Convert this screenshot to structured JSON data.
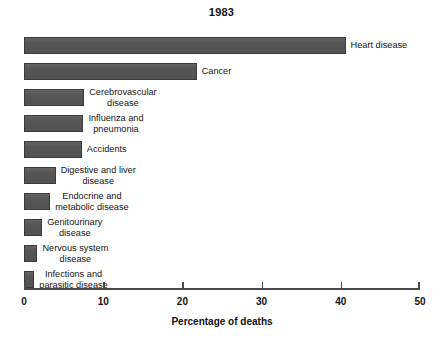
{
  "chart_data": {
    "type": "bar",
    "orientation": "horizontal",
    "title": "1983",
    "xlabel": "Percentage of deaths",
    "ylabel": "",
    "xlim": [
      0,
      50
    ],
    "xticks": [
      0,
      10,
      20,
      30,
      40,
      50
    ],
    "xtick_labels": [
      "0",
      "10",
      "20",
      "30",
      "40",
      "50"
    ],
    "grid": false,
    "legend": null,
    "bar_color": "#575757",
    "bar_edge_color": "#3a3a3a",
    "categories": [
      "Heart disease",
      "Cancer",
      "Cerebrovascular disease",
      "Influenza and pneumonia",
      "Accidents",
      "Digestive and liver disease",
      "Endocrine and metabolic disease",
      "Genitourinary disease",
      "Nervous system disease",
      "Infections and parasitic disease"
    ],
    "values": [
      40.6,
      21.8,
      7.6,
      7.5,
      7.3,
      4.0,
      3.3,
      2.3,
      1.7,
      1.3
    ],
    "bars": [
      {
        "label_lines": [
          "Heart disease"
        ],
        "value": 40.6
      },
      {
        "label_lines": [
          "Cancer"
        ],
        "value": 21.8
      },
      {
        "label_lines": [
          "Cerebrovascular",
          "disease"
        ],
        "value": 7.6
      },
      {
        "label_lines": [
          "Influenza and",
          "pneumonia"
        ],
        "value": 7.5
      },
      {
        "label_lines": [
          "Accidents"
        ],
        "value": 7.3
      },
      {
        "label_lines": [
          "Digestive and liver",
          "disease"
        ],
        "value": 4.0
      },
      {
        "label_lines": [
          "Endocrine and",
          "metabolic disease"
        ],
        "value": 3.3
      },
      {
        "label_lines": [
          "Genitourinary",
          "disease"
        ],
        "value": 2.3
      },
      {
        "label_lines": [
          "Nervous system",
          "disease"
        ],
        "value": 1.7
      },
      {
        "label_lines": [
          "Infections and",
          "parasitic disease"
        ],
        "value": 1.3
      }
    ]
  }
}
